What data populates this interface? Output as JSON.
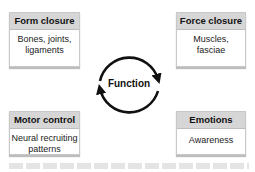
{
  "center": {
    "label": "Function"
  },
  "boxes": [
    {
      "title": "Form closure",
      "body_lines": [
        "Bones, joints,",
        "ligaments"
      ]
    },
    {
      "title": "Force closure",
      "body_lines": [
        "Muscles,",
        "fasciae"
      ]
    },
    {
      "title": "Motor control",
      "body_lines": [
        "Neural recruiting",
        "patterns"
      ]
    },
    {
      "title": "Emotions",
      "body_lines": [
        "Awareness"
      ]
    }
  ],
  "colors": {
    "header_bg": "#d6d6d6",
    "border": "#c8c8c8",
    "arrow": "#111111"
  }
}
